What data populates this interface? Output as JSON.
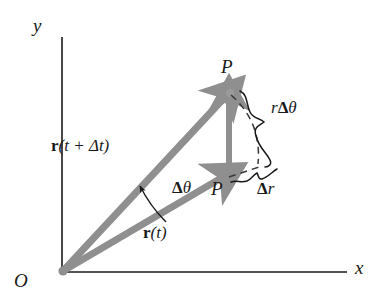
{
  "figure": {
    "background_color": "#ffffff",
    "axis_color": "#1a1a1a",
    "vector_color": "#8f8f8f",
    "dash_color": "#3a3a3a",
    "text_color": "#1a1a1a"
  },
  "axes": {
    "x_label": "x",
    "y_label": "y",
    "origin_label": "O"
  },
  "points": {
    "upper_label": "P",
    "lower_label": "P"
  },
  "vectors": [
    {
      "name": "position-vector-t-plus-dt",
      "label_r": "r",
      "label_rest": "(t + Δt)",
      "from": "O",
      "to": "P-upper"
    },
    {
      "name": "position-vector-t",
      "label_r": "r",
      "label_rest": "(t)",
      "from": "O",
      "to": "P-lower"
    },
    {
      "name": "displacement-vector",
      "from": "P-lower",
      "to": "P-upper"
    }
  ],
  "annotations": {
    "angle_delta_theta": {
      "delta": "Δ",
      "theta": "θ"
    },
    "arc_length": {
      "r": "r",
      "delta": "Δ",
      "theta": "θ"
    },
    "radial_change": {
      "delta": "Δ",
      "r": "r"
    }
  },
  "geometry": {
    "origin": [
      62,
      272
    ],
    "p_upper": [
      229,
      92
    ],
    "p_lower": [
      228,
      175
    ],
    "x_axis_end": [
      346,
      272
    ],
    "y_axis_top": [
      62,
      37
    ]
  }
}
